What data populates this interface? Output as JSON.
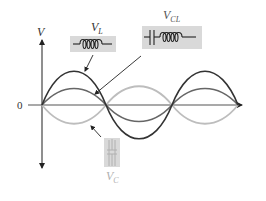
{
  "diagram": {
    "axes": {
      "y_label": "V",
      "origin_label": "0"
    },
    "labels": {
      "vl": {
        "main": "V",
        "sub": "L"
      },
      "vcl": {
        "main": "V",
        "sub": "CL"
      },
      "vc": {
        "main": "V",
        "sub": "C"
      }
    },
    "colors": {
      "vl_curve": "#333333",
      "vcl_curve": "#666666",
      "vc_curve": "#bdbdbd",
      "axis": "#555555",
      "component_box": "#d9d9d9"
    },
    "components": {
      "vl": "inductor",
      "vcl": "capacitor-inductor series",
      "vc": "capacitor"
    }
  }
}
